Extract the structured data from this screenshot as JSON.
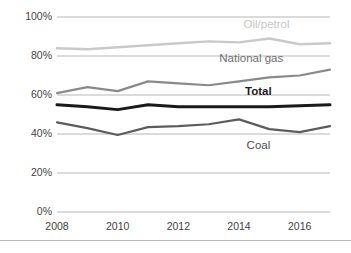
{
  "chart_data": {
    "type": "line",
    "title": "",
    "subtitle": "",
    "xlabel": "",
    "ylabel": "",
    "x": [
      2008,
      2009,
      2010,
      2011,
      2012,
      2013,
      2014,
      2015,
      2016,
      2017
    ],
    "xtick_labels": [
      "2008",
      "2010",
      "2012",
      "2014",
      "2016"
    ],
    "xtick_values": [
      2008,
      2010,
      2012,
      2014,
      2016
    ],
    "ytick_labels": [
      "100%",
      "80%",
      "60%",
      "40%",
      "20%",
      "0%"
    ],
    "ytick_values": [
      100,
      80,
      60,
      40,
      20,
      0
    ],
    "ylim": [
      0,
      100
    ],
    "xlim": [
      2008,
      2017
    ],
    "grid": "horizontal",
    "legend": "inline-labels",
    "value_unit": "%",
    "series": [
      {
        "name": "Oil/petrol",
        "color": "#c9c9c9",
        "line_width": 2.4,
        "label_x": 2014.15,
        "label_y": 96,
        "values": [
          84,
          83.5,
          84.5,
          85.5,
          86.5,
          87.5,
          87,
          89,
          86,
          86.5
        ]
      },
      {
        "name": "National gas",
        "color": "#8a8a8a",
        "line_width": 2.2,
        "label_x": 2013.35,
        "label_y": 78.5,
        "values": [
          61,
          64,
          62,
          67,
          66,
          65,
          67,
          69,
          70,
          73
        ]
      },
      {
        "name": "Total",
        "color": "#1a1a1a",
        "line_width": 3.0,
        "label_x": 2014.2,
        "label_y": 61.5,
        "values": [
          55,
          54,
          52.5,
          55,
          54,
          54,
          54,
          54,
          54.5,
          55
        ]
      },
      {
        "name": "Coal",
        "color": "#5c5c5c",
        "line_width": 2.2,
        "label_x": 2014.25,
        "label_y": 34,
        "values": [
          46,
          43,
          39.5,
          43.5,
          44,
          45,
          47.5,
          42.5,
          41,
          44
        ]
      }
    ],
    "colors": {
      "grid": "#b7b7b7",
      "axis_text": "#3f3f3f",
      "background": "#ffffff",
      "frame": "#b9b9b9"
    }
  }
}
